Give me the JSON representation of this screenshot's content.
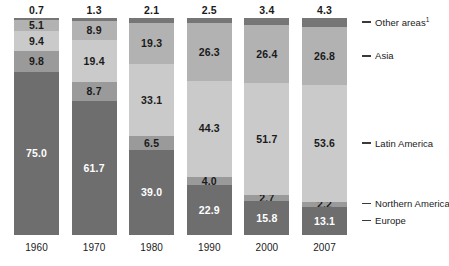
{
  "chart_data": {
    "type": "bar",
    "subtype": "stacked-bar-100-percent",
    "title": "",
    "subtitle": "",
    "xlabel": "",
    "ylabel": "",
    "ylim": [
      0,
      100
    ],
    "grid": false,
    "legend_position": "right",
    "categories": [
      "1960",
      "1970",
      "1980",
      "1990",
      "2000",
      "2007"
    ],
    "series": [
      {
        "name": "Other areas",
        "name_display": "Other areas",
        "footnote_marker": "1",
        "color": "#767676",
        "values": [
          0.7,
          1.3,
          2.1,
          2.5,
          3.4,
          4.3
        ],
        "labels_outside_top": [
          "0.7",
          "1.3",
          "2.1",
          "2.5",
          "3.4",
          "4.3"
        ],
        "label_color": "#1a1a1a"
      },
      {
        "name": "Asia",
        "name_display": "Asia",
        "color": "#b2b2b2",
        "values": [
          5.1,
          8.9,
          19.3,
          26.3,
          26.4,
          26.8
        ],
        "labels": [
          "5.1",
          "8.9",
          "19.3",
          "26.3",
          "26.4",
          "26.8"
        ],
        "label_color": "#1a1a1a"
      },
      {
        "name": "Latin America",
        "name_display": "Latin America",
        "color": "#cacaca",
        "values": [
          9.4,
          19.4,
          33.1,
          44.3,
          51.7,
          53.6
        ],
        "labels": [
          "9.4",
          "19.4",
          "33.1",
          "44.3",
          "51.7",
          "53.6"
        ],
        "label_color": "#1a1a1a"
      },
      {
        "name": "Northern America",
        "name_display": "Northern America",
        "color": "#9a9a9a",
        "values": [
          9.8,
          8.7,
          6.5,
          4.0,
          2.7,
          2.2
        ],
        "labels": [
          "9.8",
          "8.7",
          "6.5",
          "4.0",
          "2.7",
          "2.2"
        ],
        "label_color": "#1a1a1a"
      },
      {
        "name": "Europe",
        "name_display": "Europe",
        "color": "#6e6e6e",
        "values": [
          75.0,
          61.7,
          39.0,
          22.9,
          15.8,
          13.1
        ],
        "labels": [
          "75.0",
          "61.7",
          "39.0",
          "22.9",
          "15.8",
          "13.1"
        ],
        "label_color": "#ffffff"
      }
    ],
    "legend_entries": [
      {
        "label": "Other areas",
        "footnote": "1"
      },
      {
        "label": "Asia",
        "footnote": ""
      },
      {
        "label": "Latin America",
        "footnote": ""
      },
      {
        "label": "Northern America",
        "footnote": ""
      },
      {
        "label": "Europe",
        "footnote": ""
      }
    ]
  },
  "axis": {
    "x_tick_labels": [
      "1960",
      "1970",
      "1980",
      "1990",
      "2000",
      "2007"
    ]
  },
  "colors": {
    "background": "#ffffff",
    "other_areas": "#767676",
    "asia": "#b2b2b2",
    "latin_america": "#cacaca",
    "northern_america": "#9a9a9a",
    "europe": "#6e6e6e",
    "text_dark": "#1a1a1a",
    "text_light": "#ffffff",
    "legend_dash": "#3a3a3a"
  }
}
